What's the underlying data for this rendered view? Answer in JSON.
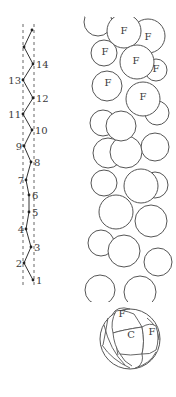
{
  "figure": {
    "left_panel": {
      "title": "helical-strand-schematic",
      "points": [
        {
          "label": "1",
          "x": 33,
          "y": 280,
          "side": "right"
        },
        {
          "label": "2",
          "x": 24,
          "y": 263,
          "side": "left"
        },
        {
          "label": "3",
          "x": 31,
          "y": 247,
          "side": "right"
        },
        {
          "label": "4",
          "x": 26,
          "y": 229,
          "side": "left"
        },
        {
          "label": "5",
          "x": 29,
          "y": 212,
          "side": "right"
        },
        {
          "label": "6",
          "x": 29,
          "y": 195,
          "side": "right"
        },
        {
          "label": "7",
          "x": 26,
          "y": 180,
          "side": "left"
        },
        {
          "label": "8",
          "x": 31,
          "y": 162,
          "side": "right"
        },
        {
          "label": "9",
          "x": 24,
          "y": 146,
          "side": "left"
        },
        {
          "label": "10",
          "x": 32,
          "y": 130,
          "side": "right"
        },
        {
          "label": "11",
          "x": 23,
          "y": 114,
          "side": "left"
        },
        {
          "label": "12",
          "x": 33,
          "y": 98,
          "side": "right"
        },
        {
          "label": "13",
          "x": 23,
          "y": 80,
          "side": "left"
        },
        {
          "label": "14",
          "x": 33,
          "y": 64,
          "side": "right"
        },
        {
          "label": "",
          "x": 24,
          "y": 47,
          "side": "left"
        },
        {
          "label": "",
          "x": 32,
          "y": 30,
          "side": "right"
        }
      ]
    },
    "middle_panel": {
      "title": "filament-side-view",
      "labels": [
        {
          "text": "F",
          "x": 124,
          "y": 34
        },
        {
          "text": "F",
          "x": 148,
          "y": 40
        },
        {
          "text": "F",
          "x": 105,
          "y": 55
        },
        {
          "text": "F",
          "x": 136,
          "y": 64
        },
        {
          "text": "F",
          "x": 156,
          "y": 72
        },
        {
          "text": "F",
          "x": 108,
          "y": 86
        },
        {
          "text": "F",
          "x": 143,
          "y": 100
        }
      ]
    },
    "bottom_panel": {
      "title": "filament-end-view",
      "labels": [
        {
          "text": "F",
          "x": 122,
          "y": 317
        },
        {
          "text": "C",
          "x": 131,
          "y": 338
        },
        {
          "text": "F",
          "x": 152,
          "y": 335
        }
      ]
    }
  }
}
